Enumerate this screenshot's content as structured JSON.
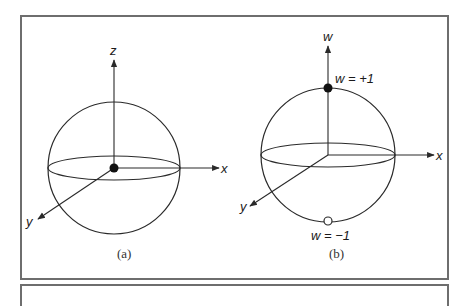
{
  "figure": {
    "panels": [
      {
        "id": "a",
        "caption": "(a)",
        "axes": {
          "vertical": "z",
          "horizontal": "x",
          "depth": "y"
        },
        "points": [
          {
            "label": "",
            "position": "center",
            "style": "filled"
          }
        ]
      },
      {
        "id": "b",
        "caption": "(b)",
        "axes": {
          "vertical": "w",
          "horizontal": "x",
          "depth": "y"
        },
        "points": [
          {
            "label": "w = +1",
            "position": "top",
            "style": "filled"
          },
          {
            "label": "w = −1",
            "position": "bottom",
            "style": "open"
          }
        ]
      }
    ]
  },
  "colors": {
    "stroke": "#2a2a2a",
    "frame": "#6e6e6e",
    "background": "#ffffff"
  }
}
